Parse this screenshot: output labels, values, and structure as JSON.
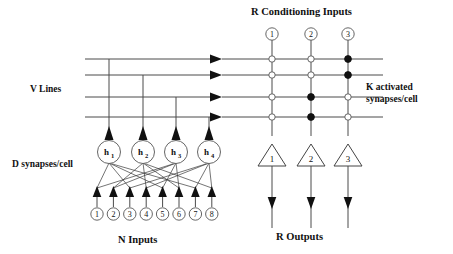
{
  "figure": {
    "title_top": "R  Conditioning Inputs",
    "title_bottom_left": "N Inputs",
    "title_bottom_right": "R  Outputs",
    "label_left_upper": "V Lines",
    "label_left_lower": "D synapses/cell",
    "label_right_line1": "K activated",
    "label_right_line2": "synapses/cell"
  },
  "colors": {
    "wire": "#4a4a4a",
    "ink": "#111111",
    "open_fill": "#ffffff",
    "filled_fill": "#111111",
    "background": "#ffffff"
  },
  "input_layer": {
    "name": "N Inputs",
    "count": 8,
    "nodes": [
      {
        "label": "1"
      },
      {
        "label": "2"
      },
      {
        "label": "3"
      },
      {
        "label": "4"
      },
      {
        "label": "5"
      },
      {
        "label": "6"
      },
      {
        "label": "7"
      },
      {
        "label": "8"
      }
    ]
  },
  "hidden_layer": {
    "name": "D synapses/cell",
    "count": 4,
    "nodes": [
      {
        "label": "h",
        "sub": "1"
      },
      {
        "label": "h",
        "sub": "2"
      },
      {
        "label": "h",
        "sub": "3"
      },
      {
        "label": "h",
        "sub": "4"
      }
    ]
  },
  "v_lines": {
    "name": "V Lines",
    "count": 4,
    "rows": [
      {
        "index": 1
      },
      {
        "index": 2
      },
      {
        "index": 3
      },
      {
        "index": 4
      }
    ]
  },
  "conditioning_inputs": {
    "name": "R Conditioning Inputs",
    "count": 3,
    "nodes": [
      {
        "label": "1"
      },
      {
        "label": "2"
      },
      {
        "label": "3"
      }
    ]
  },
  "outputs": {
    "name": "R Outputs",
    "count": 3,
    "nodes": [
      {
        "label": "1"
      },
      {
        "label": "2"
      },
      {
        "label": "3"
      }
    ]
  },
  "synapse_matrix": {
    "description": "K activated synapses/cell",
    "rows": 4,
    "cols": 3,
    "states": [
      [
        "open",
        "open",
        "filled"
      ],
      [
        "open",
        "open",
        "filled"
      ],
      [
        "open",
        "filled",
        "open"
      ],
      [
        "open",
        "filled",
        "open"
      ]
    ]
  },
  "fanout_edges": [
    [
      1,
      1
    ],
    [
      1,
      3
    ],
    [
      1,
      5
    ],
    [
      1,
      7
    ],
    [
      2,
      2
    ],
    [
      2,
      4
    ],
    [
      2,
      6
    ],
    [
      2,
      8
    ],
    [
      3,
      1
    ],
    [
      3,
      2
    ],
    [
      3,
      5
    ],
    [
      3,
      6
    ],
    [
      4,
      3
    ],
    [
      4,
      4
    ],
    [
      4,
      7
    ],
    [
      4,
      8
    ]
  ]
}
